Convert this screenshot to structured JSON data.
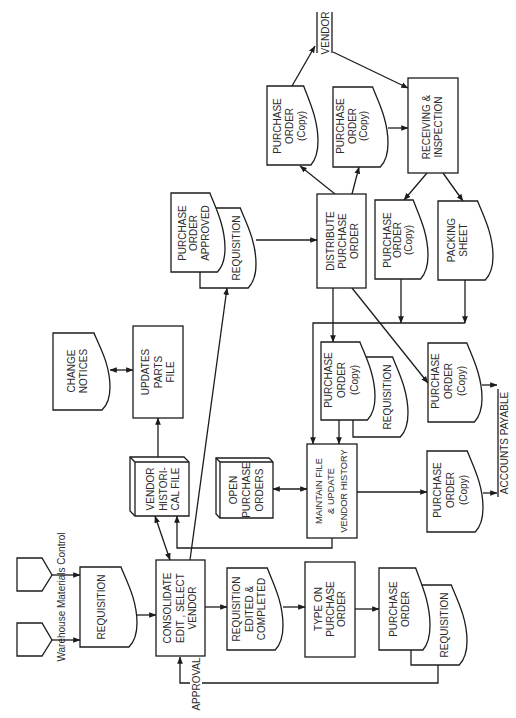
{
  "diagram": {
    "type": "flowchart",
    "orientation": "rotated-90-ccw",
    "sources": {
      "label": "Warehouse Materials Control",
      "connectors": 2
    },
    "nodes": {
      "requisition": {
        "shape": "document",
        "lines": [
          "REQUISITION"
        ]
      },
      "consolidate": {
        "shape": "process",
        "lines": [
          "CONSOLIDATE",
          "EDIT , SELECT",
          "VENDOR"
        ]
      },
      "requisition_edited": {
        "shape": "document",
        "lines": [
          "REQUISITION",
          "EDITED &",
          "COMPLETED"
        ]
      },
      "type_purchase_order": {
        "shape": "process",
        "lines": [
          "TYPE ON",
          "PURCHASE",
          "ORDER"
        ]
      },
      "purchase_order_with_requisition": {
        "front": {
          "shape": "document",
          "lines": [
            "PURCHASE",
            "ORDER"
          ]
        },
        "back": {
          "shape": "document",
          "lines": [
            "REQUISITION"
          ]
        }
      },
      "vendor_historical_file": {
        "shape": "file",
        "lines": [
          "VENDOR",
          "HISTORI-",
          "CAL FILE"
        ]
      },
      "open_purchase_orders": {
        "shape": "file",
        "lines": [
          "OPEN",
          "PURCHASE",
          "ORDERS"
        ]
      },
      "maintain_file": {
        "shape": "process",
        "lines": [
          "MAINTAIN FILE",
          "& UPDATE",
          "VENDOR HISTORY"
        ]
      },
      "updates_parts_file": {
        "shape": "process",
        "lines": [
          "UPDATES",
          "PARTS",
          "FILE"
        ]
      },
      "change_notices": {
        "shape": "document",
        "lines": [
          "CHANGE",
          "NOTICES"
        ]
      },
      "po_approved_with_requisition": {
        "front": {
          "shape": "document",
          "lines": [
            "PURCHASE",
            "ORDER",
            "APPROVED"
          ]
        },
        "back": {
          "shape": "document",
          "lines": [
            "REQUISITION"
          ]
        }
      },
      "distribute_purchase_order": {
        "shape": "process",
        "lines": [
          "DISTRIBUTE",
          "PURCHASE",
          "ORDER"
        ]
      },
      "po_copy_to_vendor": {
        "shape": "document",
        "lines": [
          "PURCHASE",
          "ORDER",
          "(Copy)"
        ]
      },
      "po_copy_to_receiving": {
        "shape": "document",
        "lines": [
          "PURCHASE",
          "ORDER",
          "(Copy)"
        ]
      },
      "receiving_inspection": {
        "shape": "process",
        "lines": [
          "RECEIVING &",
          "INSPECTION"
        ]
      },
      "po_copy_from_receiving": {
        "shape": "document",
        "lines": [
          "PURCHASE",
          "ORDER",
          "(Copy)"
        ]
      },
      "packing_sheet": {
        "shape": "document",
        "lines": [
          "PACKING",
          "SHEET"
        ]
      },
      "po_copy_with_requisition": {
        "front": {
          "shape": "document",
          "lines": [
            "PURCHASE",
            "ORDER",
            "(Copy)"
          ]
        },
        "back": {
          "shape": "document",
          "lines": [
            "REQUISITION"
          ]
        }
      },
      "po_copy_to_ap_upper": {
        "shape": "document",
        "lines": [
          "PURCHASE",
          "ORDER",
          "(Copy)"
        ]
      },
      "po_copy_to_ap_lower": {
        "shape": "document",
        "lines": [
          "PURCHASE",
          "ORDER",
          "(Copy)"
        ]
      }
    },
    "labels": {
      "approval": "APPROVAL",
      "vendor": "VENDOR",
      "accounts_payable": "ACCOUNTS PAYABLE"
    },
    "edges": [
      {
        "from": "source_connector_1",
        "to": "requisition"
      },
      {
        "from": "source_connector_2",
        "to": "requisition"
      },
      {
        "from": "requisition",
        "to": "consolidate"
      },
      {
        "from": "consolidate",
        "to": "requisition_edited"
      },
      {
        "from": "requisition_edited",
        "to": "type_purchase_order"
      },
      {
        "from": "type_purchase_order",
        "to": "purchase_order_with_requisition"
      },
      {
        "from": "purchase_order_with_requisition",
        "to": "consolidate",
        "label": "APPROVAL"
      },
      {
        "from": "consolidate",
        "to": "vendor_historical_file",
        "bidirectional": true
      },
      {
        "from": "consolidate",
        "to": "po_approved_with_requisition"
      },
      {
        "from": "vendor_historical_file",
        "to": "updates_parts_file"
      },
      {
        "from": "change_notices",
        "to": "updates_parts_file",
        "bidirectional": true
      },
      {
        "from": "maintain_file",
        "to": "vendor_historical_file"
      },
      {
        "from": "open_purchase_orders",
        "to": "maintain_file",
        "bidirectional": true
      },
      {
        "from": "po_approved_with_requisition",
        "to": "distribute_purchase_order"
      },
      {
        "from": "distribute_purchase_order",
        "to": "po_copy_to_vendor"
      },
      {
        "from": "distribute_purchase_order",
        "to": "po_copy_to_receiving"
      },
      {
        "from": "po_copy_to_vendor",
        "to": "vendor"
      },
      {
        "from": "vendor",
        "to": "receiving_inspection"
      },
      {
        "from": "po_copy_to_receiving",
        "to": "receiving_inspection"
      },
      {
        "from": "receiving_inspection",
        "to": "po_copy_from_receiving"
      },
      {
        "from": "receiving_inspection",
        "to": "packing_sheet"
      },
      {
        "from": "po_copy_from_receiving",
        "to": "maintain_file"
      },
      {
        "from": "packing_sheet",
        "to": "maintain_file"
      },
      {
        "from": "distribute_purchase_order",
        "to": "po_copy_with_requisition"
      },
      {
        "from": "distribute_purchase_order",
        "to": "po_copy_to_ap_upper"
      },
      {
        "from": "po_copy_with_requisition",
        "to": "maintain_file"
      },
      {
        "from": "po_copy_to_ap_upper",
        "to": "accounts_payable"
      },
      {
        "from": "maintain_file",
        "to": "po_copy_to_ap_lower"
      },
      {
        "from": "po_copy_to_ap_lower",
        "to": "accounts_payable"
      }
    ]
  }
}
